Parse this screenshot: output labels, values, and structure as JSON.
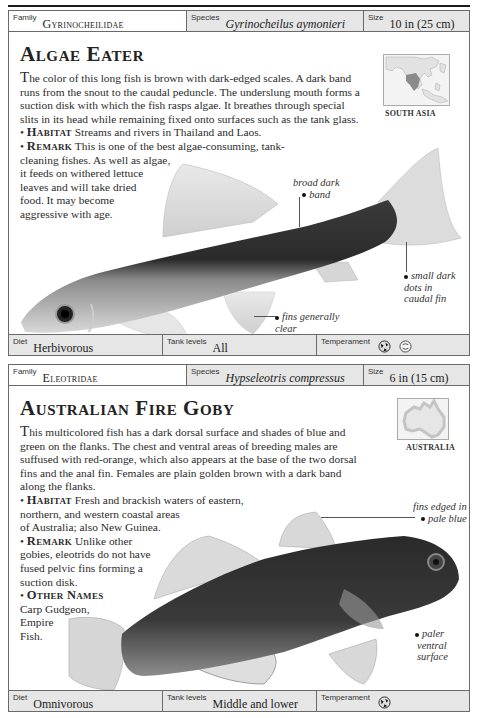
{
  "entries": [
    {
      "family_label": "Family",
      "family": "Gyrinocheilidae",
      "species_label": "Species",
      "species": "Gyrinocheilus aymonieri",
      "size_label": "Size",
      "size": "10 in (25 cm)",
      "title": "Algae Eater",
      "description_first_letter": "T",
      "description_rest": "he color of this long fish is brown with dark-edged scales. A dark band runs from the snout to the caudal peduncle. The underslung mouth forms a suction disk with which the fish rasps algae. It breathes through special slits in its head while remaining fixed onto surfaces such as the tank glass.",
      "habitat_label": "Habitat",
      "habitat": "Streams and rivers in Thailand and Laos.",
      "remark_label": "Remark",
      "remark_line1": "This is one of the best algae-consuming, tank-",
      "remark_line2": "cleaning fishes. As well as algae,",
      "remark_line3": "it feeds on withered lettuce",
      "remark_line4": "leaves and will take dried",
      "remark_line5": "food. It may become",
      "remark_line6": "aggressive with age.",
      "map_label": "SOUTH ASIA",
      "annotations": {
        "band_1": "broad dark",
        "band_2": "band",
        "dots_1": "small dark",
        "dots_2": "dots in",
        "dots_3": "caudal fin",
        "fins_1": "fins generally",
        "fins_2": "clear"
      },
      "diet_label": "Diet",
      "diet": "Herbivorous",
      "tank_label": "Tank levels",
      "tank": "All",
      "temperament_label": "Temperament",
      "temperament_icons": [
        "aggressive-fish-icon",
        "peaceful-fish-icon"
      ]
    },
    {
      "family_label": "Family",
      "family": "Eleotridae",
      "species_label": "Species",
      "species": "Hypseleotris compressus",
      "size_label": "Size",
      "size": "6 in (15 cm)",
      "title": "Australian Fire Goby",
      "description_first_letter": "T",
      "description_rest": "his multicolored fish has a dark dorsal surface and shades of blue and green on the flanks. The chest and ventral areas of breeding males are suffused with red-orange, which also appears at the base of the two dorsal fins and the anal fin. Females are plain golden brown with a dark band along the flanks.",
      "habitat_label": "Habitat",
      "habitat_line1": "Fresh and brackish waters of eastern,",
      "habitat_line2": "northern, and western coastal areas",
      "habitat_line3": "of Australia; also New Guinea.",
      "remark_label": "Remark",
      "remark_line1": "Unlike other",
      "remark_line2": "gobies, eleotrids do not have",
      "remark_line3": "fused pelvic fins forming a",
      "remark_line4": "suction disk.",
      "other_names_label": "Other Names",
      "other_names_line1": "Carp Gudgeon,",
      "other_names_line2": "Empire",
      "other_names_line3": "Fish.",
      "map_label": "AUSTRALIA",
      "annotations": {
        "fins_1": "fins edged in",
        "fins_2": "pale blue",
        "ventral_1": "paler",
        "ventral_2": "ventral",
        "ventral_3": "surface"
      },
      "diet_label": "Diet",
      "diet": "Omnivorous",
      "tank_label": "Tank levels",
      "tank": "Middle and lower",
      "temperament_label": "Temperament",
      "temperament_icons": [
        "semi-aggressive-fish-icon"
      ]
    }
  ]
}
